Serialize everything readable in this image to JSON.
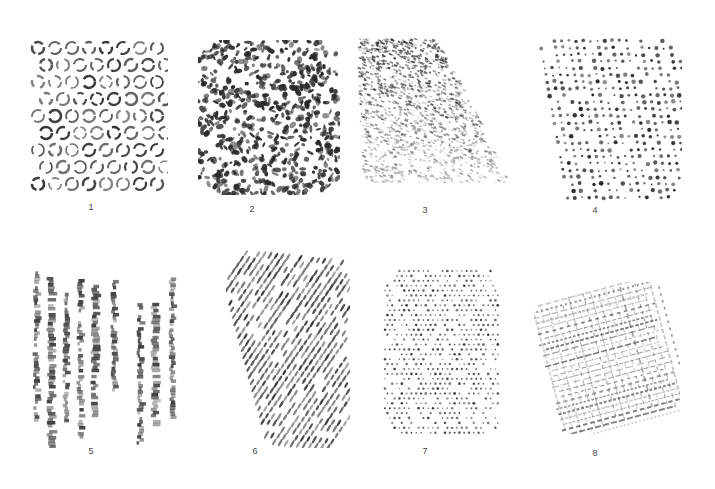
{
  "samples": [
    {
      "id": 1,
      "label": "1",
      "texture": "circles",
      "box": [
        28,
        38,
        140,
        160
      ],
      "label_pos": [
        91,
        208
      ]
    },
    {
      "id": 2,
      "label": "2",
      "texture": "dense-blotches",
      "box": [
        198,
        40,
        142,
        155
      ],
      "label_pos": [
        252,
        210
      ]
    },
    {
      "id": 3,
      "label": "3",
      "texture": "diagonal-shaded",
      "box": [
        356,
        38,
        160,
        145
      ],
      "label_pos": [
        425,
        211
      ]
    },
    {
      "id": 4,
      "label": "4",
      "texture": "dot-grid",
      "box": [
        536,
        36,
        146,
        168
      ],
      "label_pos": [
        595,
        211
      ]
    },
    {
      "id": 5,
      "label": "5",
      "texture": "vertical-streaks",
      "box": [
        30,
        252,
        152,
        196
      ],
      "label_pos": [
        91,
        452
      ]
    },
    {
      "id": 6,
      "label": "6",
      "texture": "diagonal-dots",
      "box": [
        226,
        250,
        124,
        198
      ],
      "label_pos": [
        255,
        452
      ]
    },
    {
      "id": 7,
      "label": "7",
      "texture": "fine-dots",
      "box": [
        382,
        268,
        118,
        170
      ],
      "label_pos": [
        425,
        452
      ]
    },
    {
      "id": 8,
      "label": "8",
      "texture": "crosshatch-grid",
      "box": [
        534,
        282,
        146,
        152
      ],
      "label_pos": [
        595,
        454
      ]
    }
  ],
  "ink_color": "#2a2a2a"
}
